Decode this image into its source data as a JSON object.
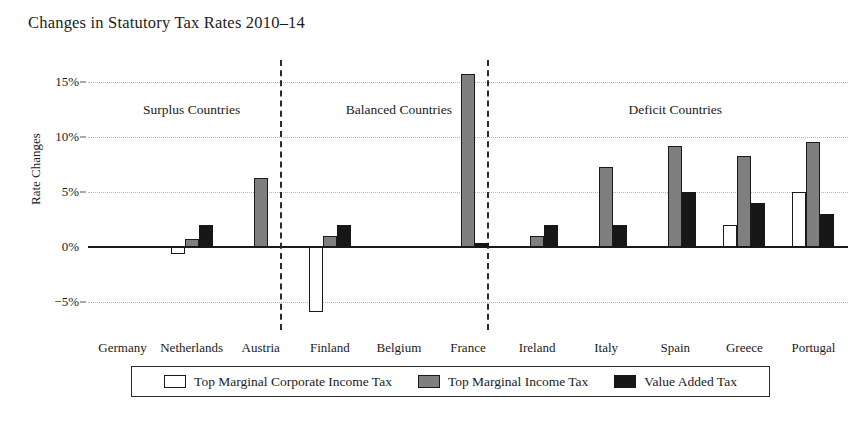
{
  "chart_data": {
    "type": "bar",
    "title": "Changes in Statutory Tax Rates 2010–14",
    "xlabel": "",
    "ylabel": "Rate Changes",
    "ylim": [
      -7.5,
      17.0
    ],
    "yticks": [
      -5,
      0,
      5,
      10,
      15
    ],
    "ytick_labels": [
      "−5%",
      "0%",
      "5%",
      "10%",
      "15%"
    ],
    "grid": true,
    "legend_position": "bottom",
    "categories": [
      "Germany",
      "Netherlands",
      "Austria",
      "Finland",
      "Belgium",
      "France",
      "Ireland",
      "Italy",
      "Spain",
      "Greece",
      "Portugal"
    ],
    "series": [
      {
        "name": "Top Marginal Corporate Income Tax",
        "color": "#ffffff",
        "values": [
          0,
          -0.6,
          0,
          -5.9,
          0,
          0,
          0,
          0,
          0,
          2.0,
          5.0
        ]
      },
      {
        "name": "Top Marginal Income Tax",
        "color": "#7f7f7f",
        "values": [
          0,
          0.75,
          6.3,
          1.0,
          0,
          15.7,
          1.0,
          7.3,
          9.2,
          8.3,
          9.6
        ]
      },
      {
        "name": "Value Added Tax",
        "color": "#171717",
        "values": [
          0,
          2.0,
          0,
          2.0,
          0,
          0.4,
          2.0,
          2.0,
          5.0,
          4.0,
          3.0
        ]
      }
    ],
    "groups": [
      {
        "label": "Surplus Countries",
        "members": [
          "Germany",
          "Netherlands",
          "Austria"
        ]
      },
      {
        "label": "Balanced Countries",
        "members": [
          "Finland",
          "Belgium",
          "France"
        ]
      },
      {
        "label": "Deficit Countries",
        "members": [
          "Ireland",
          "Italy",
          "Spain",
          "Greece",
          "Portugal"
        ]
      }
    ],
    "annotations": []
  },
  "legend": {
    "items": [
      {
        "label": "Top Marginal Corporate Income Tax",
        "swatch": "white"
      },
      {
        "label": "Top Marginal Income Tax",
        "swatch": "gray"
      },
      {
        "label": "Value Added Tax",
        "swatch": "black"
      }
    ]
  }
}
